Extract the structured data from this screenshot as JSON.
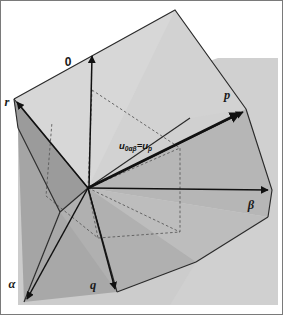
{
  "figure": {
    "width": 283,
    "height": 315,
    "background_color": "#ffffff"
  },
  "axes": [
    {
      "id": "zero",
      "label": "0",
      "style": "upright",
      "label_x": 68,
      "label_y": 66,
      "tip_x": 92,
      "tip_y": 52,
      "description": "zero-sequence vertical axis"
    },
    {
      "id": "beta",
      "label": "β",
      "style": "italic",
      "label_x": 251,
      "label_y": 209,
      "tip_x": 272,
      "tip_y": 190,
      "description": "beta horizontal axis to the right"
    },
    {
      "id": "alpha",
      "label": "α",
      "style": "italic",
      "label_x": 10,
      "label_y": 288,
      "tip_x": 24,
      "tip_y": 302,
      "description": "alpha axis toward lower left"
    }
  ],
  "vertices": [
    {
      "id": "p",
      "label": "p",
      "label_x": 227,
      "label_y": 99,
      "tip_x": 246,
      "tip_y": 109,
      "description": "phase p axis upper right"
    },
    {
      "id": "r",
      "label": "r",
      "label_x": 6,
      "label_y": 106,
      "tip_x": 14,
      "tip_y": 99,
      "description": "phase r axis upper left"
    },
    {
      "id": "q",
      "label": "q",
      "label_x": 92,
      "label_y": 288,
      "tip_x": 117,
      "tip_y": 292,
      "description": "phase q axis lower center"
    }
  ],
  "vector": {
    "id": "u0ab",
    "base": "u",
    "subscript": "0αβ",
    "equals": "=",
    "base2": "u",
    "subscript2": "p",
    "full_text": "u0αβ = up",
    "label_x": 119,
    "label_y": 149,
    "origin_x": 88,
    "origin_y": 188,
    "tip_x": 244,
    "tip_y": 111,
    "description": "space vector u0alphabeta coincident with up"
  },
  "origin": {
    "x": 88,
    "y": 188
  },
  "colors": {
    "background_plane": "#d0d0d0",
    "face_light": "#d7d7d7",
    "face_light2": "#cfcfcf",
    "face_mid": "#b6b6b6",
    "face_mid2": "#bdbdbd",
    "face_dark": "#9b9b9b",
    "face_dark2": "#a5a5a5",
    "line": "#1a1a1a",
    "dashed": "#4a4a4a",
    "border": "#7a7a7a",
    "text": "#1a1a1a"
  },
  "geometry": {
    "note": "Two intersecting planes forming the pqr and 0-alpha-beta frames with a dashed hexagonal projection of the vector tips."
  }
}
